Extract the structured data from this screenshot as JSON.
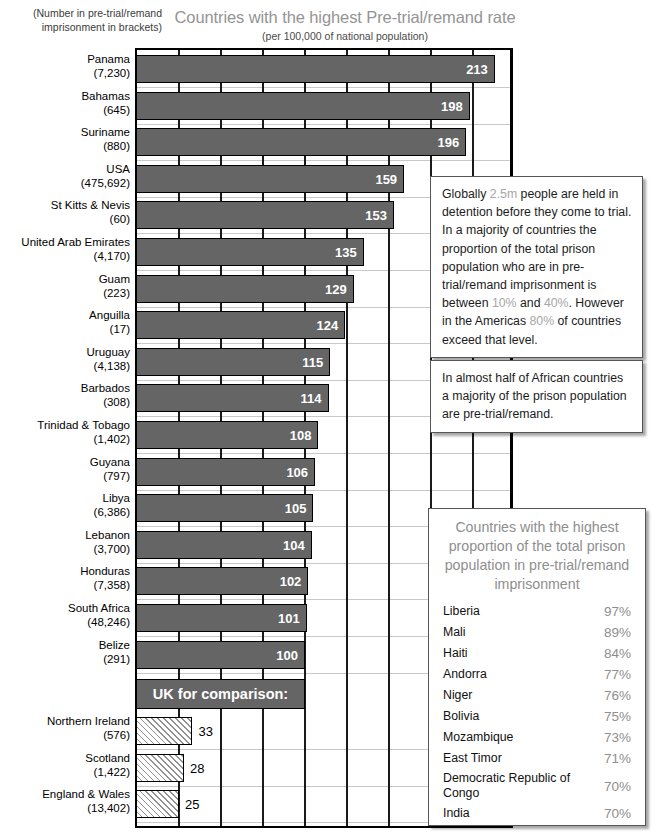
{
  "header": {
    "bracket_note": "(Number in pre-trial/remand imprisonment in brackets)",
    "title": "Countries with the highest Pre-trial/remand rate",
    "subtitle": "(per 100,000 of national population)"
  },
  "uk_banner": {
    "label": "UK for comparison:"
  },
  "chart_data": {
    "type": "bar",
    "orientation": "horizontal",
    "title": "Countries with the highest Pre-trial/remand rate",
    "subtitle": "(per 100,000 of national population)",
    "xlabel": "Pre-trial/remand rate per 100,000 of national population",
    "ylabel": "",
    "xlim": [
      0,
      225
    ],
    "xtick_step": 25,
    "grid": "vertical",
    "legend": "none",
    "categories": [
      "Panama",
      "Bahamas",
      "Suriname",
      "USA",
      "St Kitts & Nevis",
      "United Arab Emirates",
      "Guam",
      "Anguilla",
      "Uruguay",
      "Barbados",
      "Trinidad & Tobago",
      "Guyana",
      "Libya",
      "Lebanon",
      "Honduras",
      "South Africa",
      "Belize",
      "Northern Ireland",
      "Scotland",
      "England & Wales"
    ],
    "values": [
      213,
      198,
      196,
      159,
      153,
      135,
      129,
      124,
      115,
      114,
      108,
      106,
      105,
      104,
      102,
      101,
      100,
      33,
      28,
      25
    ],
    "counts": [
      "7,230",
      "645",
      "880",
      "475,692",
      "60",
      "4,170",
      "223",
      "17",
      "4,138",
      "308",
      "1,402",
      "797",
      "6,386",
      "3,700",
      "7,358",
      "48,246",
      "291",
      "576",
      "1,422",
      "13,402"
    ],
    "bars": [
      {
        "name": "Panama",
        "count": "7,230",
        "value": 213,
        "style": "solid"
      },
      {
        "name": "Bahamas",
        "count": "645",
        "value": 198,
        "style": "solid"
      },
      {
        "name": "Suriname",
        "count": "880",
        "value": 196,
        "style": "solid"
      },
      {
        "name": "USA",
        "count": "475,692",
        "value": 159,
        "style": "solid"
      },
      {
        "name": "St Kitts & Nevis",
        "count": "60",
        "value": 153,
        "style": "solid"
      },
      {
        "name": "United Arab Emirates",
        "count": "4,170",
        "value": 135,
        "style": "solid"
      },
      {
        "name": "Guam",
        "count": "223",
        "value": 129,
        "style": "solid"
      },
      {
        "name": "Anguilla",
        "count": "17",
        "value": 124,
        "style": "solid"
      },
      {
        "name": "Uruguay",
        "count": "4,138",
        "value": 115,
        "style": "solid"
      },
      {
        "name": "Barbados",
        "count": "308",
        "value": 114,
        "style": "solid"
      },
      {
        "name": "Trinidad & Tobago",
        "count": "1,402",
        "value": 108,
        "style": "solid"
      },
      {
        "name": "Guyana",
        "count": "797",
        "value": 106,
        "style": "solid"
      },
      {
        "name": "Libya",
        "count": "6,386",
        "value": 105,
        "style": "solid"
      },
      {
        "name": "Lebanon",
        "count": "3,700",
        "value": 104,
        "style": "solid"
      },
      {
        "name": "Honduras",
        "count": "7,358",
        "value": 102,
        "style": "solid"
      },
      {
        "name": "South Africa",
        "count": "48,246",
        "value": 101,
        "style": "solid"
      },
      {
        "name": "Belize",
        "count": "291",
        "value": 100,
        "style": "solid"
      },
      {
        "name": "Northern Ireland",
        "count": "576",
        "value": 33,
        "style": "hatched"
      },
      {
        "name": "Scotland",
        "count": "1,422",
        "value": 28,
        "style": "hatched"
      },
      {
        "name": "England & Wales",
        "count": "13,402",
        "value": 25,
        "style": "hatched"
      }
    ],
    "colors": {
      "bar_fill": "#656565",
      "bar_outline": "#000000",
      "hatch_fill": "#ffffff",
      "title": "#949494",
      "highlight": "#a6a6a6"
    }
  },
  "callout_1": {
    "segments": [
      {
        "text": "Globally ",
        "highlight": false
      },
      {
        "text": "2.5m",
        "highlight": true
      },
      {
        "text": " people are held in detention before they come to trial. In a majority of countries the proportion of the total prison population who are in pre-trial/remand imprisonment is between ",
        "highlight": false
      },
      {
        "text": "10%",
        "highlight": true
      },
      {
        "text": " and ",
        "highlight": false
      },
      {
        "text": "40%",
        "highlight": true
      },
      {
        "text": ". However in the Americas ",
        "highlight": false
      },
      {
        "text": "80%",
        "highlight": true
      },
      {
        "text": " of countries exceed that level.",
        "highlight": false
      }
    ]
  },
  "callout_2": {
    "text": "In almost half of African countries a majority of the prison population are pre-trial/remand."
  },
  "percent_panel": {
    "title": "Countries with the highest proportion of the total prison population in pre-trial/remand imprisonment",
    "rows": [
      {
        "name": "Liberia",
        "value": "97%"
      },
      {
        "name": "Mali",
        "value": "89%"
      },
      {
        "name": "Haiti",
        "value": "84%"
      },
      {
        "name": "Andorra",
        "value": "77%"
      },
      {
        "name": "Niger",
        "value": "76%"
      },
      {
        "name": "Bolivia",
        "value": "75%"
      },
      {
        "name": "Mozambique",
        "value": "73%"
      },
      {
        "name": "East Timor",
        "value": "71%"
      },
      {
        "name": "Democratic Republic of Congo",
        "value": "70%"
      },
      {
        "name": "India",
        "value": "70%"
      }
    ]
  }
}
